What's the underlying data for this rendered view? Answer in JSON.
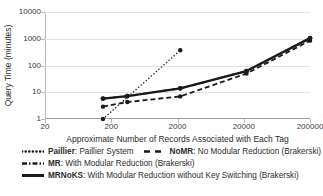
{
  "chart_data": {
    "type": "line",
    "title": "",
    "xlabel": "Approximate Number of Records Associated with Each Tag",
    "ylabel": "Query Time (minutes)",
    "xscale": "log",
    "yscale": "log",
    "xlim": [
      20,
      200000
    ],
    "ylim": [
      1,
      10000
    ],
    "grid": true,
    "legend_position": "bottom",
    "xticks": [
      "20",
      "200",
      "2000",
      "20000",
      "200000"
    ],
    "xtick_values": [
      20,
      200,
      2000,
      20000,
      200000
    ],
    "yticks": [
      "1",
      "10",
      "100",
      "1000",
      "10000"
    ],
    "ytick_values": [
      1,
      10,
      100,
      1000,
      10000
    ],
    "series": [
      {
        "name": "Paillier",
        "style": "dotted",
        "x": [
          150,
          2200
        ],
        "values": [
          1.0,
          370
        ]
      },
      {
        "name": "NoMR",
        "style": "dashed",
        "x": [
          150,
          350,
          2200,
          22000,
          200000
        ],
        "values": [
          2.9,
          4.3,
          7.0,
          50,
          850
        ]
      },
      {
        "name": "MR",
        "style": "dash-dot",
        "x": [
          150,
          350,
          2200,
          22000,
          200000
        ],
        "values": [
          5.8,
          7.2,
          14,
          62,
          1030
        ]
      },
      {
        "name": "MRNoKS",
        "style": "solid",
        "x": [
          150,
          350,
          2200,
          22000,
          200000
        ],
        "values": [
          5.8,
          7.2,
          14,
          62,
          1050
        ]
      }
    ]
  },
  "legend": {
    "rows": [
      [
        {
          "swatch": "dotted",
          "key": "Paillier",
          "desc": ": Paillier System"
        },
        {
          "swatch": "dashed",
          "key": "NoMR",
          "desc": ": No Modular Reduction (Brakerski)"
        }
      ],
      [
        {
          "swatch": "dash-dot",
          "key": "MR",
          "desc": ": With Modular Reduction (Brakerski)"
        }
      ],
      [
        {
          "swatch": "solid",
          "key": "MRNoKS",
          "desc": ": With Modular Reduction without Key Switching (Brakerski)"
        }
      ]
    ]
  },
  "colors": {
    "series": "#1a1a1a",
    "grid": "#e2e2e2",
    "axis": "#9a9a9a",
    "text": "#2b2b2b",
    "background": "#ffffff"
  }
}
